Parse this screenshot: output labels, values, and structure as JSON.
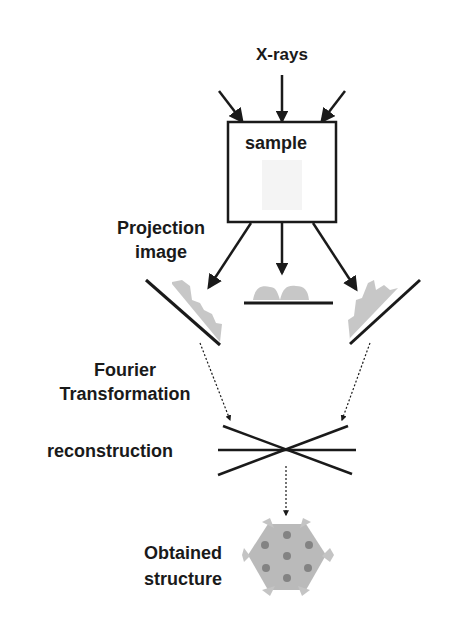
{
  "diagram": {
    "labels": {
      "xrays": "X-rays",
      "sample": "sample",
      "projection_line1": "Projection",
      "projection_line2": "image",
      "fourier_line1": "Fourier",
      "fourier_line2": "Transformation",
      "reconstruction": "reconstruction",
      "obtained_line1": "Obtained",
      "obtained_line2": "structure"
    },
    "colors": {
      "line": "#1a1a1a",
      "projection_fill": "#b8b8b8",
      "structure_fill": "#b0b0b0",
      "structure_spot": "#7a7a7a"
    }
  }
}
